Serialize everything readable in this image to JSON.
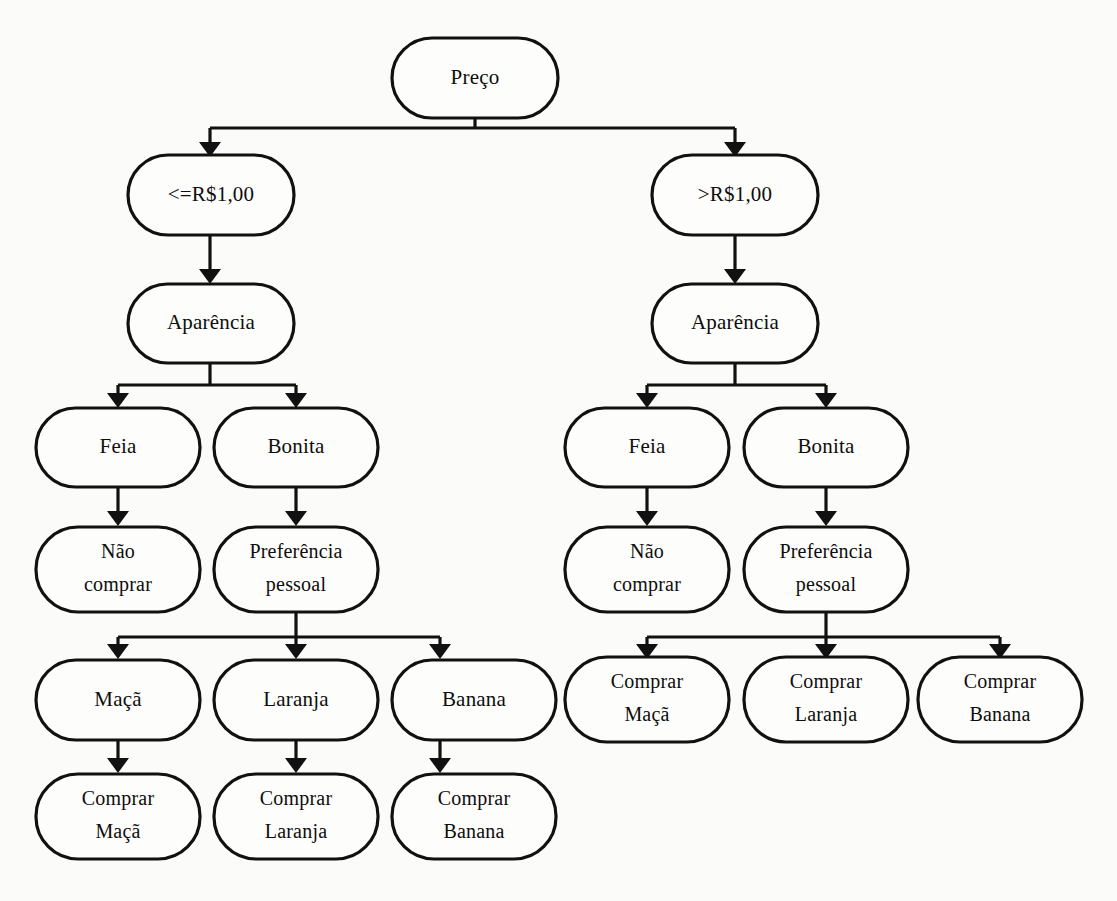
{
  "diagram": {
    "kind": "decision-tree",
    "language": "pt-BR",
    "background_color": "#fbfbf9",
    "node_fill": "#fdfdfb",
    "stroke_color": "#111111",
    "root": {
      "id": "preco",
      "label": "Preço"
    },
    "branches": [
      {
        "id": "branch-left",
        "condition_label": "<=R$1,00",
        "attribute_label": "Aparência",
        "appearance_options": [
          {
            "id": "feia-left",
            "label": "Feia"
          },
          {
            "id": "bonita-left",
            "label": "Bonita"
          }
        ],
        "outcomes": [
          {
            "id": "nao-comprar-left",
            "line1": "Não",
            "line2": "comprar"
          },
          {
            "id": "preferencia-left",
            "line1": "Preferência",
            "line2": "pessoal"
          }
        ],
        "fruit_choices": [
          {
            "id": "maca-left",
            "label": "Maçã"
          },
          {
            "id": "laranja-left",
            "label": "Laranja"
          },
          {
            "id": "banana-left",
            "label": "Banana"
          }
        ],
        "fruit_actions": [
          {
            "id": "comprar-maca-left",
            "line1": "Comprar",
            "line2": "Maçã"
          },
          {
            "id": "comprar-laranja-left",
            "line1": "Comprar",
            "line2": "Laranja"
          },
          {
            "id": "comprar-banana-left",
            "line1": "Comprar",
            "line2": "Banana"
          }
        ]
      },
      {
        "id": "branch-right",
        "condition_label": ">R$1,00",
        "attribute_label": "Aparência",
        "appearance_options": [
          {
            "id": "feia-right",
            "label": "Feia"
          },
          {
            "id": "bonita-right",
            "label": "Bonita"
          }
        ],
        "outcomes": [
          {
            "id": "nao-comprar-right",
            "line1": "Não",
            "line2": "comprar"
          },
          {
            "id": "preferencia-right",
            "line1": "Preferência",
            "line2": "pessoal"
          }
        ],
        "fruit_choices": [],
        "fruit_actions": [
          {
            "id": "comprar-maca-right",
            "line1": "Comprar",
            "line2": "Maçã"
          },
          {
            "id": "comprar-laranja-right",
            "line1": "Comprar",
            "line2": "Laranja"
          },
          {
            "id": "comprar-banana-right",
            "line1": "Comprar",
            "line2": "Banana"
          }
        ]
      }
    ]
  }
}
